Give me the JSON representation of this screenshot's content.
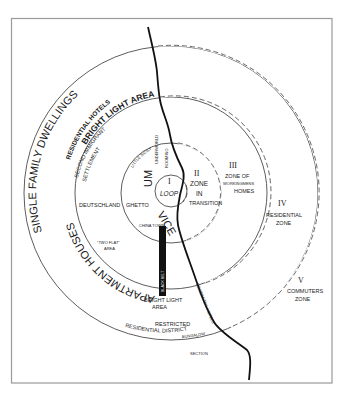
{
  "diagram": {
    "zones": [
      {
        "numeral": "I",
        "label": "LOOP"
      },
      {
        "numeral": "II",
        "label_lines": [
          "ZONE",
          "IN",
          "TRANSITION"
        ]
      },
      {
        "numeral": "III",
        "label_lines": [
          "ZONE OF",
          "WORKINGMENS",
          "HOMES"
        ]
      },
      {
        "numeral": "IV",
        "label_lines": [
          "RESIDENTIAL",
          "ZONE"
        ]
      },
      {
        "numeral": "V",
        "label_lines": [
          "COMMUTERS",
          "ZONE"
        ]
      }
    ],
    "arc_labels": {
      "single_family": "SINGLE FAMILY DWELLINGS",
      "residential_hotels": "RESIDENTIAL HOTELS",
      "bright_light_area_top": "BRIGHT LIGHT AREA",
      "apartment_houses": "APARTMENT HOUSES",
      "second_immigrant": "SECOND IMMIGRANT",
      "settlement": "SETTLEMENT",
      "slum": "SLUM",
      "vice": "VICE"
    },
    "area_labels": {
      "deutschland": "DEUTSCHLAND",
      "ghetto": "GHETTO",
      "little_sicily": "LITTLE SICILY",
      "underworld": "UNDERWORLD",
      "rooming": "ROOMING",
      "china_town": "CHINA TOWN",
      "black_belt": "BLACK BELT",
      "two_flat_line1": "\"TWO FLAT\"",
      "two_flat_line2": "AREA",
      "bright_light_bottom_line1": "BRIGHT LIGHT",
      "bright_light_bottom_line2": "AREA",
      "restricted_line1": "RESTRICTED",
      "restricted_line2": "RESIDENTIAL DISTRICT",
      "residential_hotels_river": "RESIDENTIAL HOTELS",
      "bungalow_line1": "BUNGALOW",
      "bungalow_line2": "SECTION"
    },
    "colors": {
      "ink": "#1a1a1a",
      "frame": "#9a9a9a",
      "background": "#ffffff"
    }
  }
}
